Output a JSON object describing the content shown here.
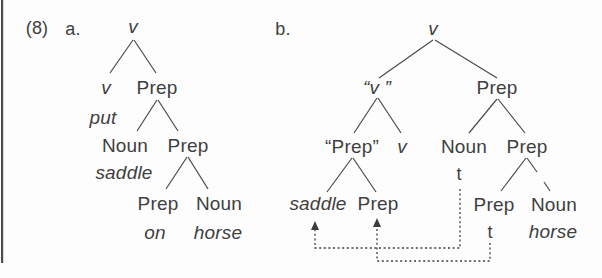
{
  "figure": {
    "number": "(8)",
    "item_a_label": "a.",
    "item_b_label": "b."
  },
  "tree_a": {
    "root": "v",
    "v_head": "v",
    "prep_1": "Prep",
    "put": "put",
    "noun_1": "Noun",
    "prep_2": "Prep",
    "saddle": "saddle",
    "prep_3": "Prep",
    "noun_2": "Noun",
    "on": "on",
    "horse": "horse"
  },
  "tree_b": {
    "root": "v",
    "v_quoted": "“v ”",
    "prep_top": "Prep",
    "prep_quoted": "“Prep”",
    "v_lower": "v",
    "noun_1": "Noun",
    "trace_1": "t",
    "saddle": "saddle",
    "prep_a": "Prep",
    "prep_mid": "Prep",
    "prep_b": "Prep",
    "noun_2": "Noun",
    "trace_2": "t",
    "horse": "horse"
  },
  "colors": {
    "text": "#3f3f3f",
    "branch_line": "#4a4a4a",
    "movement_arrow": "#3d3d3d",
    "page_border": "#4d4d4d",
    "background": "#fdfdfd"
  }
}
